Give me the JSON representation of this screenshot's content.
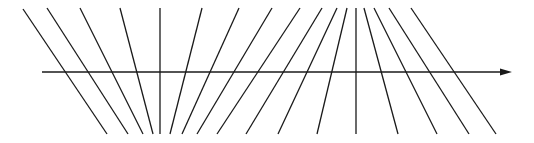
{
  "diagram": {
    "type": "line-family-with-axis",
    "stroke_color": "#1a1a1a",
    "background": "#ffffff",
    "axis": {
      "x1": 42,
      "y1": 72,
      "x2": 502,
      "y2": 72,
      "arrow_tip": [
        512,
        72
      ],
      "direction": "right"
    },
    "lines": [
      {
        "top": [
          23,
          9
        ],
        "bottom": [
          107,
          134
        ]
      },
      {
        "top": [
          47,
          8
        ],
        "bottom": [
          128,
          134
        ]
      },
      {
        "top": [
          80,
          8
        ],
        "bottom": [
          143,
          134
        ]
      },
      {
        "top": [
          120,
          8
        ],
        "bottom": [
          153,
          134
        ]
      },
      {
        "top": [
          160,
          8
        ],
        "bottom": [
          160,
          134
        ]
      },
      {
        "top": [
          202,
          8
        ],
        "bottom": [
          170,
          134
        ]
      },
      {
        "top": [
          239,
          8
        ],
        "bottom": [
          182,
          134
        ]
      },
      {
        "top": [
          272,
          8
        ],
        "bottom": [
          197,
          134
        ]
      },
      {
        "top": [
          300,
          8
        ],
        "bottom": [
          217,
          134
        ]
      },
      {
        "top": [
          322,
          8
        ],
        "bottom": [
          246,
          134
        ]
      },
      {
        "top": [
          337,
          8
        ],
        "bottom": [
          278,
          134
        ]
      },
      {
        "top": [
          347,
          8
        ],
        "bottom": [
          317,
          134
        ]
      },
      {
        "top": [
          356,
          8
        ],
        "bottom": [
          356,
          134
        ]
      },
      {
        "top": [
          364,
          8
        ],
        "bottom": [
          398,
          134
        ]
      },
      {
        "top": [
          374,
          8
        ],
        "bottom": [
          437,
          134
        ]
      },
      {
        "top": [
          389,
          8
        ],
        "bottom": [
          469,
          134
        ]
      },
      {
        "top": [
          411,
          8
        ],
        "bottom": [
          496,
          134
        ]
      }
    ]
  }
}
